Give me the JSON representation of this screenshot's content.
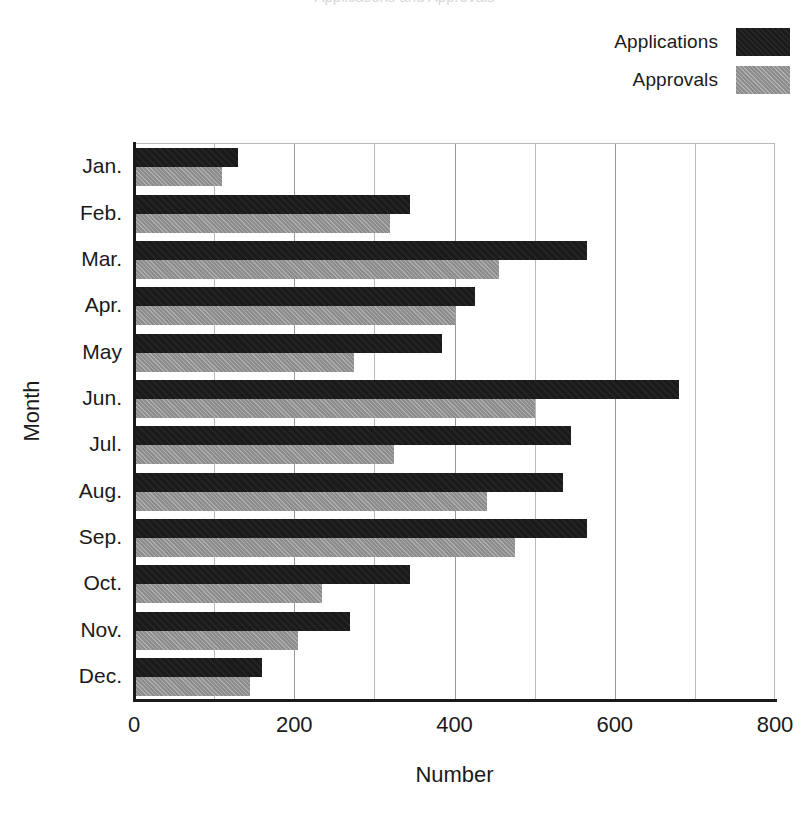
{
  "figure": {
    "clipped_top_text": "Applications and Approvals",
    "background_color": "#ffffff"
  },
  "legend": {
    "position": "top-right",
    "entries": [
      {
        "label": "Applications",
        "swatch": "dark-swatch",
        "color": "#1a1a1a"
      },
      {
        "label": "Approvals",
        "swatch": "gray-swatch",
        "color": "#8d8d8d"
      }
    ]
  },
  "axes": {
    "x": {
      "title": "Number",
      "min": 0,
      "max": 800,
      "tick_labels": [
        "0",
        "200",
        "400",
        "600",
        "800"
      ],
      "tick_values": [
        0,
        200,
        400,
        600,
        800
      ],
      "minor_step": 100,
      "grid": true
    },
    "y": {
      "title": "Month",
      "tick_labels": [
        "Jan.",
        "Feb.",
        "Mar.",
        "Apr.",
        "May",
        "Jun.",
        "Jul.",
        "Aug.",
        "Sep.",
        "Oct.",
        "Nov.",
        "Dec."
      ],
      "grid": false
    }
  },
  "chart_data": {
    "type": "bar",
    "orientation": "horizontal",
    "title": "Applications and Approvals",
    "xlabel": "Number",
    "ylabel": "Month",
    "xlim": [
      0,
      800
    ],
    "xticks": [
      0,
      200,
      400,
      600,
      800
    ],
    "minor_gridline_step": 100,
    "grid": true,
    "legend_position": "top-right",
    "categories": [
      "Jan.",
      "Feb.",
      "Mar.",
      "Apr.",
      "May",
      "Jun.",
      "Jul.",
      "Aug.",
      "Sep.",
      "Oct.",
      "Nov.",
      "Dec."
    ],
    "series": [
      {
        "name": "Applications",
        "color": "#1a1a1a",
        "values": [
          130,
          345,
          565,
          425,
          385,
          680,
          545,
          535,
          565,
          345,
          270,
          160
        ]
      },
      {
        "name": "Approvals",
        "color": "#8d8d8d",
        "values": [
          110,
          320,
          455,
          400,
          275,
          500,
          325,
          440,
          475,
          235,
          205,
          145
        ]
      }
    ]
  }
}
